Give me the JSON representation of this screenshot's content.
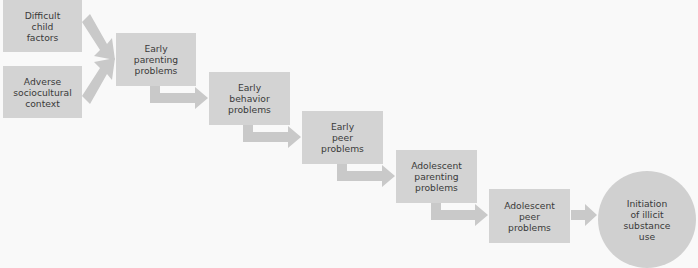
{
  "diagram": {
    "title": "",
    "colors": {
      "background": "#f9f9f9",
      "box_fill": "#d3d3d3",
      "arrow_fill": "#c9c9c9",
      "outcome_fill": "#d0d0d0",
      "text": "#3a3a3a"
    },
    "nodes": [
      {
        "id": "difficult-child-factors",
        "label": "Difficult\nchild\nfactors"
      },
      {
        "id": "adverse-sociocultural-context",
        "label": "Adverse\nsociocultural\ncontext"
      },
      {
        "id": "early-parenting-problems",
        "label": "Early\nparenting\nproblems"
      },
      {
        "id": "early-behavior-problems",
        "label": "Early\nbehavior\nproblems"
      },
      {
        "id": "early-peer-problems",
        "label": "Early\npeer\nproblems"
      },
      {
        "id": "adolescent-parenting-problems",
        "label": "Adolescent\nparenting\nproblems"
      },
      {
        "id": "adolescent-peer-problems",
        "label": "Adolescent\npeer\nproblems"
      },
      {
        "id": "initiation-of-illicit-substance-use",
        "label": "Initiation\nof illicit\nsubstance\nuse",
        "shape": "circle"
      }
    ],
    "edges": [
      {
        "from": "difficult-child-factors",
        "to": "early-parenting-problems"
      },
      {
        "from": "adverse-sociocultural-context",
        "to": "early-parenting-problems"
      },
      {
        "from": "early-parenting-problems",
        "to": "early-behavior-problems"
      },
      {
        "from": "early-behavior-problems",
        "to": "early-peer-problems"
      },
      {
        "from": "early-peer-problems",
        "to": "adolescent-parenting-problems"
      },
      {
        "from": "adolescent-parenting-problems",
        "to": "adolescent-peer-problems"
      },
      {
        "from": "adolescent-peer-problems",
        "to": "initiation-of-illicit-substance-use"
      }
    ]
  }
}
